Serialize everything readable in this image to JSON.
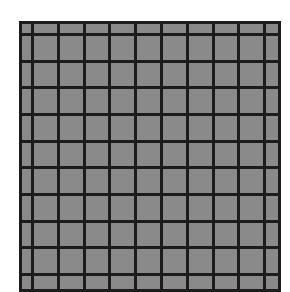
{
  "figure": {
    "fill_color": "#8a8a8a",
    "line_color": "#1c1c1c",
    "background": "#ffffff",
    "grid_origin": [
      19,
      21
    ],
    "vertical_lines_x": [
      0,
      12,
      38,
      64,
      89,
      115,
      141,
      167,
      193,
      218,
      244,
      259
    ],
    "horizontal_lines_y": [
      0,
      12,
      39,
      65,
      92,
      119,
      145,
      172,
      199,
      225,
      252,
      268
    ]
  }
}
